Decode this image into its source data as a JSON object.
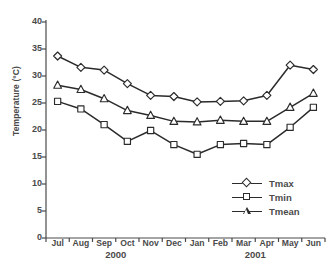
{
  "chart_data": {
    "type": "line",
    "title": "",
    "xlabel": "",
    "ylabel": "Temperature (°C)",
    "ylim": [
      0,
      40
    ],
    "ytick_step": 5,
    "yticks": [
      0,
      5,
      10,
      15,
      20,
      25,
      30,
      35,
      40
    ],
    "ytick_labels": [
      "0",
      "5",
      "10",
      "15",
      "20",
      "25",
      "30",
      "35",
      "40"
    ],
    "grid": false,
    "legend_position": "inside-lower-right",
    "categories": [
      "Jul",
      "Aug",
      "Sep",
      "Oct",
      "Nov",
      "Dec",
      "Jan",
      "Feb",
      "Mar",
      "Apr",
      "May",
      "Jun"
    ],
    "x_group_labels": [
      {
        "label": "2000",
        "start": "Jul",
        "end": "Dec"
      },
      {
        "label": "2001",
        "start": "Jan",
        "end": "Jun"
      }
    ],
    "series": [
      {
        "name": "Tmax",
        "marker": "diamond",
        "color": "#2b2b2b",
        "values": [
          33.7,
          31.6,
          31.1,
          28.6,
          26.4,
          26.2,
          25.2,
          25.3,
          25.4,
          26.4,
          32.0,
          31.2
        ]
      },
      {
        "name": "Tmin",
        "marker": "square",
        "color": "#2b2b2b",
        "values": [
          25.3,
          23.9,
          21.0,
          17.9,
          19.9,
          17.3,
          15.5,
          17.3,
          17.5,
          17.3,
          20.5,
          24.2
        ]
      },
      {
        "name": "Tmean",
        "marker": "triangle",
        "color": "#2b2b2b",
        "values": [
          28.3,
          27.5,
          25.8,
          23.6,
          22.7,
          21.6,
          21.5,
          21.8,
          21.6,
          21.6,
          24.2,
          26.8
        ]
      }
    ]
  },
  "legend": {
    "items": [
      {
        "label": "Tmax",
        "marker": "diamond"
      },
      {
        "label": "Tmin",
        "marker": "square"
      },
      {
        "label": "Tmean",
        "marker": "triangle"
      }
    ]
  },
  "axes": {
    "y_title": "Temperature (°C)"
  }
}
